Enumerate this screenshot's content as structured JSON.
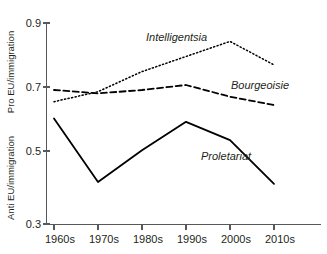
{
  "chart_data": {
    "type": "line",
    "title": "",
    "xlabel": "",
    "ylabel_top": "Pro EU/immigration",
    "ylabel_bottom": "Anti EU/immigration",
    "categories": [
      "1960s",
      "1970s",
      "1980s",
      "1990s",
      "2000s",
      "2010s"
    ],
    "ylim": [
      0.3,
      0.9
    ],
    "yticks": [
      "0.9",
      "0.7",
      "0.5",
      "0.3"
    ],
    "ytick_values": [
      0.9,
      0.7,
      0.5,
      0.3
    ],
    "grid": false,
    "legend_position": "inline-annotations",
    "series": [
      {
        "name": "Intelligentsia",
        "style": "dotted",
        "color": "#000000",
        "values": [
          0.665,
          0.695,
          0.755,
          0.8,
          0.845,
          0.775
        ],
        "label_x": 0.145,
        "label_y": 0.865
      },
      {
        "name": "Bourgeoisie",
        "style": "dashed",
        "color": "#000000",
        "values": [
          0.7,
          0.69,
          0.7,
          0.715,
          0.68,
          0.655
        ],
        "label_x": 0.23,
        "label_y": 0.725
      },
      {
        "name": "Proletariat",
        "style": "solid",
        "color": "#000000",
        "values": [
          0.615,
          0.425,
          0.52,
          0.605,
          0.55,
          0.42
        ],
        "label_x": 0.195,
        "label_y": 0.49
      }
    ]
  },
  "axis": {
    "y_title_top": "Pro EU/immigration",
    "y_title_bottom": "Anti EU/immigration",
    "y_labels": [
      "0.9",
      "0.7",
      "0.5",
      "0.3"
    ],
    "x_labels": [
      "1960s",
      "1970s",
      "1980s",
      "1990s",
      "2000s",
      "2010s"
    ]
  },
  "labels": {
    "intelligentsia": "Intelligentsia",
    "bourgeoisie": "Bourgeoisie",
    "proletariat": "Proletariat"
  },
  "colors": {
    "axis": "#58595b",
    "ink": "#231f20",
    "background": "#ffffff"
  }
}
